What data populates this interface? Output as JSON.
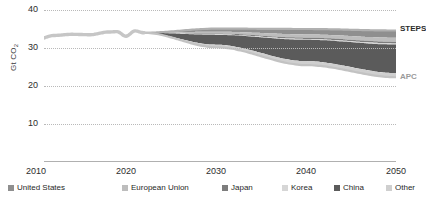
{
  "chart_data": {
    "type": "area",
    "title": "",
    "subtitle": "",
    "xlabel": "",
    "ylabel": "Gt CO2",
    "ylabel_display": "Gt CO",
    "ylabel_sub": "2",
    "xlim": [
      2010,
      2050
    ],
    "ylim": [
      0,
      40
    ],
    "yticks": [
      40,
      30,
      20,
      10
    ],
    "xticks": [
      2010,
      2020,
      2030,
      2040,
      2050
    ],
    "grid": "horizontal-dotted",
    "legend_position": "bottom",
    "historical": {
      "name": "Historical emissions",
      "x": [
        2010,
        2012,
        2014,
        2016,
        2018,
        2019,
        2020,
        2021,
        2022
      ],
      "values": [
        32.2,
        33.3,
        33.6,
        33.5,
        34.2,
        34.3,
        33.1,
        34.5,
        34.0
      ]
    },
    "scenarios": [
      {
        "name": "STEPS",
        "x": [
          2022,
          2030,
          2040,
          2050
        ],
        "values": [
          34.0,
          35.1,
          35.0,
          34.6
        ]
      },
      {
        "name": "APC",
        "x": [
          2022,
          2030,
          2040,
          2050
        ],
        "values": [
          34.0,
          30.2,
          25.5,
          22.3
        ]
      }
    ],
    "categories": [
      "United States",
      "European Union",
      "Japan",
      "Korea",
      "China",
      "Other"
    ],
    "series": [
      {
        "name": "United States",
        "color": "#8f8f8f",
        "x": [
          2022,
          2030,
          2040,
          2050
        ],
        "values": [
          0.0,
          0.8,
          1.5,
          1.9
        ]
      },
      {
        "name": "European Union",
        "color": "#bdbdbd",
        "x": [
          2022,
          2030,
          2040,
          2050
        ],
        "values": [
          0.0,
          0.5,
          0.9,
          1.1
        ]
      },
      {
        "name": "Japan",
        "color": "#7d7d7d",
        "x": [
          2022,
          2030,
          2040,
          2050
        ],
        "values": [
          0.0,
          0.2,
          0.35,
          0.4
        ]
      },
      {
        "name": "Korea",
        "color": "#d6d6d6",
        "x": [
          2022,
          2030,
          2040,
          2050
        ],
        "values": [
          0.0,
          0.15,
          0.25,
          0.3
        ]
      },
      {
        "name": "China",
        "color": "#5b5b5b",
        "x": [
          2022,
          2030,
          2040,
          2050
        ],
        "values": [
          0.0,
          2.6,
          5.9,
          7.5
        ]
      },
      {
        "name": "Other",
        "color": "#cfcfcf",
        "x": [
          2022,
          2030,
          2040,
          2050
        ],
        "values": [
          0.0,
          0.65,
          1.1,
          1.1
        ]
      }
    ],
    "annotations": [
      {
        "text": "STEPS",
        "x": 2050,
        "y": 35.0,
        "color": "#2b2b2b"
      },
      {
        "text": "APC",
        "x": 2050,
        "y": 22.3,
        "color": "#9a9a9a"
      }
    ]
  },
  "axes": {
    "y_title_main": "Gt CO",
    "y_title_sub": "2",
    "y_ticks": [
      {
        "label": "40"
      },
      {
        "label": "30"
      },
      {
        "label": "20"
      },
      {
        "label": "10"
      }
    ],
    "x_ticks": [
      {
        "label": "2010"
      },
      {
        "label": "2020"
      },
      {
        "label": "2030"
      },
      {
        "label": "2040"
      },
      {
        "label": "2050"
      }
    ]
  },
  "series_labels": {
    "steps": "STEPS",
    "apc": "APC"
  },
  "legend": {
    "items": [
      {
        "label": "United States",
        "color": "#8f8f8f"
      },
      {
        "label": "European Union",
        "color": "#bdbdbd"
      },
      {
        "label": "Japan",
        "color": "#7d7d7d"
      },
      {
        "label": "Korea",
        "color": "#d6d6d6"
      },
      {
        "label": "China",
        "color": "#5b5b5b"
      },
      {
        "label": "Other",
        "color": "#cfcfcf"
      }
    ]
  },
  "colors": {
    "historical_line": "#c6c6c6",
    "gridline": "#b9b9b9",
    "axis_line": "#b0b0b0",
    "text": "#2d2d2d",
    "steps_label": "#2b2b2b",
    "apc_label": "#9a9a9a",
    "background": "#ffffff"
  }
}
